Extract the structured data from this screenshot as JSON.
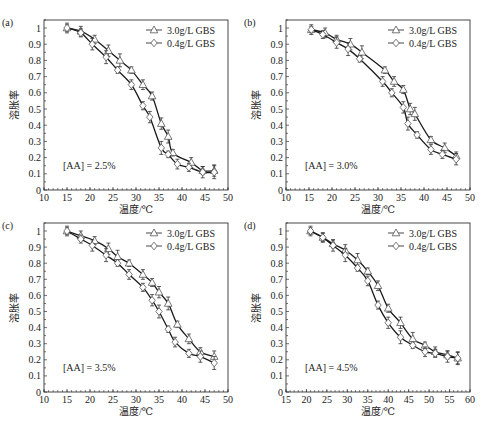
{
  "figure": {
    "ylabel": "溶胀率",
    "xlabel": "温度/℃",
    "legend": [
      {
        "label": "3.0g/L GBS",
        "marker": "triangle"
      },
      {
        "label": "0.4g/L GBS",
        "marker": "diamond"
      }
    ]
  },
  "chart_data": [
    {
      "type": "line",
      "panel": "(a)",
      "annotation": "[AA] = 2.5%",
      "xlabel": "温度/℃",
      "ylabel": "溶胀率",
      "xlim": [
        10,
        50
      ],
      "ylim": [
        0,
        1.05
      ],
      "xticks": [
        10,
        15,
        20,
        25,
        30,
        35,
        40,
        45,
        50
      ],
      "yticks": [
        0,
        0.1,
        0.2,
        0.3,
        0.4,
        0.5,
        0.6,
        0.7,
        0.8,
        0.9,
        1
      ],
      "legend_position": "upper right",
      "grid": false,
      "series": [
        {
          "name": "3.0g/L GBS",
          "marker": "triangle",
          "x": [
            15,
            18,
            21,
            24,
            26.5,
            29,
            31.5,
            33.5,
            35.5,
            37,
            38,
            42,
            44.5,
            47
          ],
          "y": [
            1.0,
            0.98,
            0.93,
            0.86,
            0.8,
            0.74,
            0.65,
            0.58,
            0.41,
            0.33,
            0.23,
            0.17,
            0.12,
            0.12
          ]
        },
        {
          "name": "0.4g/L GBS",
          "marker": "diamond",
          "x": [
            15,
            18,
            20.5,
            23.5,
            26,
            29,
            31.5,
            33,
            35.5,
            37,
            39,
            41.5,
            44.5,
            47
          ],
          "y": [
            1.0,
            0.97,
            0.9,
            0.82,
            0.74,
            0.65,
            0.52,
            0.45,
            0.26,
            0.22,
            0.16,
            0.14,
            0.11,
            0.11
          ]
        }
      ]
    },
    {
      "type": "line",
      "panel": "(b)",
      "annotation": "[AA] = 3.0%",
      "xlabel": "温度/℃",
      "ylabel": "溶胀率",
      "xlim": [
        10,
        50
      ],
      "ylim": [
        0,
        1.05
      ],
      "xticks": [
        10,
        15,
        20,
        25,
        30,
        35,
        40,
        45,
        50
      ],
      "yticks": [
        0,
        0.1,
        0.2,
        0.3,
        0.4,
        0.5,
        0.6,
        0.7,
        0.8,
        0.9,
        1
      ],
      "legend_position": "upper right",
      "grid": false,
      "series": [
        {
          "name": "3.0g/L GBS",
          "marker": "triangle",
          "x": [
            15.5,
            18.5,
            21,
            24,
            26.5,
            31.5,
            33.5,
            35.5,
            37,
            38,
            41.5,
            44.5,
            47
          ],
          "y": [
            0.99,
            0.97,
            0.93,
            0.9,
            0.85,
            0.74,
            0.67,
            0.62,
            0.5,
            0.47,
            0.31,
            0.26,
            0.21
          ]
        },
        {
          "name": "0.4g/L GBS",
          "marker": "diamond",
          "x": [
            15.5,
            18,
            21,
            23.5,
            26,
            31,
            33,
            35.5,
            36.5,
            38.5,
            41.5,
            44,
            47
          ],
          "y": [
            0.99,
            0.96,
            0.91,
            0.87,
            0.81,
            0.67,
            0.6,
            0.51,
            0.41,
            0.34,
            0.25,
            0.22,
            0.19
          ]
        }
      ]
    },
    {
      "type": "line",
      "panel": "(c)",
      "annotation": "[AA] = 3.5%",
      "xlabel": "温度/℃",
      "ylabel": "溶胀率",
      "xlim": [
        10,
        50
      ],
      "ylim": [
        0,
        1.05
      ],
      "xticks": [
        10,
        15,
        20,
        25,
        30,
        35,
        40,
        45,
        50
      ],
      "yticks": [
        0,
        0.1,
        0.2,
        0.3,
        0.4,
        0.5,
        0.6,
        0.7,
        0.8,
        0.9,
        1
      ],
      "legend_position": "upper right",
      "grid": false,
      "series": [
        {
          "name": "3.0g/L GBS",
          "marker": "triangle",
          "x": [
            15,
            18,
            21,
            24,
            26,
            28.5,
            31.5,
            33.5,
            35,
            37,
            39,
            41.5,
            44,
            47
          ],
          "y": [
            1.0,
            0.97,
            0.94,
            0.89,
            0.84,
            0.8,
            0.73,
            0.68,
            0.62,
            0.55,
            0.42,
            0.33,
            0.25,
            0.22
          ]
        },
        {
          "name": "0.4g/L GBS",
          "marker": "diamond",
          "x": [
            15,
            18,
            20.5,
            23.5,
            26,
            28.5,
            31.5,
            33.5,
            35,
            37,
            38.5,
            41.5,
            44,
            47
          ],
          "y": [
            1.0,
            0.95,
            0.91,
            0.85,
            0.8,
            0.73,
            0.65,
            0.57,
            0.5,
            0.39,
            0.31,
            0.24,
            0.22,
            0.18
          ]
        }
      ]
    },
    {
      "type": "line",
      "panel": "(d)",
      "annotation": "[AA] = 4.5%",
      "xlabel": "温度/℃",
      "ylabel": "溶胀率",
      "xlim": [
        15,
        60
      ],
      "ylim": [
        0,
        1.05
      ],
      "xticks": [
        15,
        20,
        25,
        30,
        35,
        40,
        45,
        50,
        55,
        60
      ],
      "yticks": [
        0,
        0.1,
        0.2,
        0.3,
        0.4,
        0.5,
        0.6,
        0.7,
        0.8,
        0.9,
        1
      ],
      "legend_position": "upper right",
      "grid": false,
      "series": [
        {
          "name": "3.0g/L GBS",
          "marker": "triangle",
          "x": [
            21,
            24,
            26.5,
            29.5,
            32.5,
            35,
            37.5,
            40,
            43,
            46,
            49,
            51.5,
            54.5,
            57
          ],
          "y": [
            1.0,
            0.96,
            0.92,
            0.88,
            0.82,
            0.75,
            0.66,
            0.52,
            0.43,
            0.33,
            0.29,
            0.25,
            0.23,
            0.21
          ]
        },
        {
          "name": "0.4g/L GBS",
          "marker": "diamond",
          "x": [
            21,
            24,
            26.5,
            29.5,
            32.5,
            35,
            37.5,
            40,
            43,
            46,
            49,
            51.5,
            54.5,
            57
          ],
          "y": [
            1.0,
            0.96,
            0.91,
            0.85,
            0.77,
            0.69,
            0.54,
            0.43,
            0.34,
            0.29,
            0.25,
            0.24,
            0.22,
            0.21
          ]
        }
      ]
    }
  ]
}
